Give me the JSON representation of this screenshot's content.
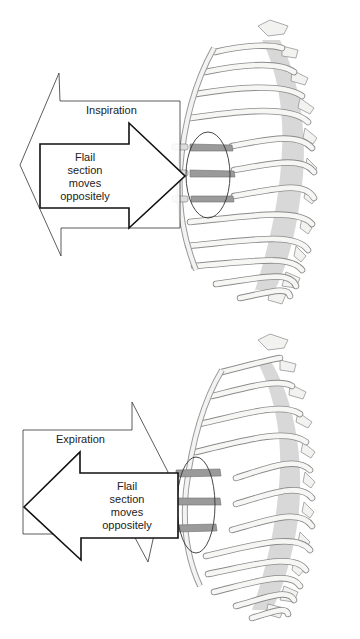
{
  "figure": {
    "type": "anatomical-diagram"
  },
  "panels": [
    {
      "phase_label": "Inspiration",
      "chest_wall_direction": "outward (left arrow)",
      "flail_direction": "inward (right arrow)",
      "flail_text_lines": [
        "Flail",
        "section",
        "moves",
        "oppositely"
      ]
    },
    {
      "phase_label": "Expiration",
      "chest_wall_direction": "inward (right arrow)",
      "flail_direction": "outward (left arrow)",
      "flail_text_lines": [
        "Flail",
        "section",
        "moves",
        "oppositely"
      ]
    }
  ],
  "colors": {
    "rib_fill": "#f4f4f2",
    "rib_stroke": "#8a8a8a",
    "flail_rib": "#9a9a9a",
    "spine_shadow": "#bdbdbd",
    "arrow_stroke": "#111111",
    "thin_arrow_stroke": "#333333"
  }
}
